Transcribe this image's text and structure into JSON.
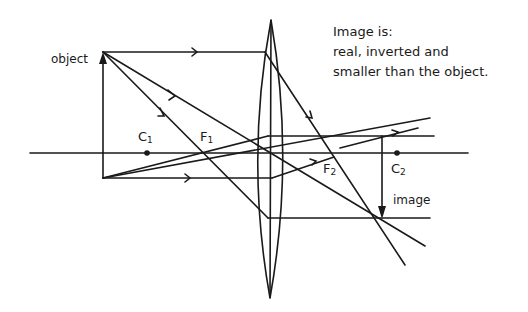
{
  "caption": {
    "heading": "Image is:",
    "line1": "real, inverted and",
    "line2": "smaller than the object."
  },
  "labels": {
    "object": "object",
    "image": "image",
    "c1": {
      "letter": "C",
      "sub": "1"
    },
    "f1": {
      "letter": "F",
      "sub": "1"
    },
    "f2": {
      "letter": "F",
      "sub": "2"
    },
    "c2": {
      "letter": "C",
      "sub": "2"
    }
  },
  "colors": {
    "ink": "#1a1a1a",
    "background": "#ffffff"
  }
}
